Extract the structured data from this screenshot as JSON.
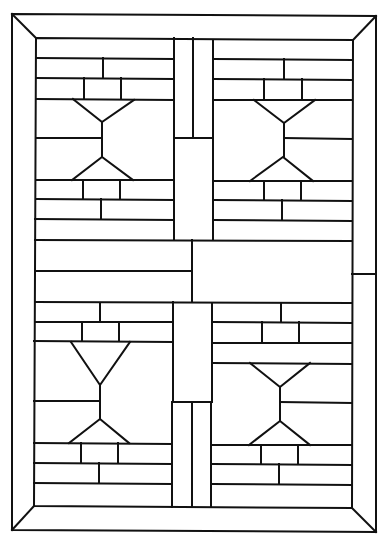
{
  "diagram": {
    "type": "stained-glass-pattern",
    "stroke_color": "#111111",
    "background_color": "#ffffff",
    "frame": {
      "outer": [
        12,
        14,
        376,
        532
      ],
      "inner": [
        36,
        38,
        352,
        508
      ]
    },
    "quadrants": [
      "top-left",
      "top-right",
      "bottom-left",
      "bottom-right"
    ],
    "motif": "hourglass"
  }
}
